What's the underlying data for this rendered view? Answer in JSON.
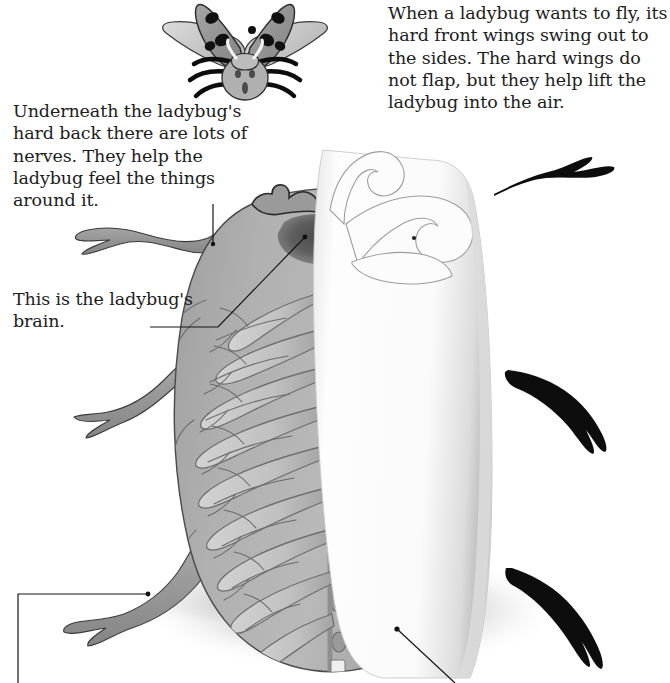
{
  "page": {
    "width": 670,
    "height": 683,
    "background": "#ffffff",
    "text_color": "#1c1c1c"
  },
  "captions": [
    {
      "id": "fly",
      "name": "caption-flight",
      "text": "When a ladybug wants to fly, its hard front wings swing out to the sides. The hard wings do not flap, but they help lift the ladybug into the air.",
      "x": 388,
      "y": 2,
      "width": 280
    },
    {
      "id": "nerves",
      "name": "caption-nerves",
      "text": "Underneath the ladybug's hard back there are lots of nerves. They help the ladybug feel the things around it.",
      "x": 13,
      "y": 100,
      "width": 235
    },
    {
      "id": "brain",
      "name": "caption-brain",
      "text": "This is the ladybug's brain.",
      "x": 13,
      "y": 288,
      "width": 200
    }
  ],
  "leaders": [
    {
      "name": "leader-nerves",
      "from": [
        213,
        208
      ],
      "to": [
        213,
        243
      ],
      "target": "front-left-leg"
    },
    {
      "name": "leader-brain",
      "from": [
        152,
        327
      ],
      "to": [
        303,
        237
      ],
      "target": "brain-region"
    },
    {
      "name": "leader-lower-left",
      "from": [
        3,
        590
      ],
      "to": [
        170,
        590
      ],
      "target": "hind-left-leg"
    },
    {
      "name": "leader-lower-right",
      "from": [
        397,
        631
      ],
      "to": [
        462,
        683
      ],
      "target": "nerve-cord"
    }
  ],
  "figures": {
    "flying_ladybug": {
      "name": "flying-ladybug-illustration",
      "x": 160,
      "y": 0,
      "width": 170,
      "height": 100,
      "parts": [
        "hind-wings",
        "spotted-elytra",
        "head",
        "legs",
        "antennae"
      ],
      "spot_count": 7,
      "colors": {
        "elytra": "#8f8f8f",
        "hindwing": "#cfcfcf",
        "spots": "#111111",
        "body": "#bdbdbd",
        "outline": "#1a1a1a"
      }
    },
    "main_ladybug": {
      "name": "ladybug-anatomy-cutaway",
      "description": "Top view of ladybug with hard wing (elytron) lifted to expose nerve network",
      "colors": {
        "body": "#a9a9a9",
        "body_light": "#c2c2c2",
        "body_dark": "#8a8a8a",
        "nerve_line": "#6d6d6d",
        "ganglion": "#8c8c8c",
        "brain": "#5a5a5a",
        "elytron": "#fbfbfb",
        "elytron_edge": "#9a9a9a",
        "leg_dark": "#0d0d0d",
        "leg_gray": "#8d8d8d",
        "shadow": "#cccccc",
        "outline": "#2a2a2a"
      },
      "ganglia_count": 8,
      "nerve_pairs": 9
    }
  }
}
